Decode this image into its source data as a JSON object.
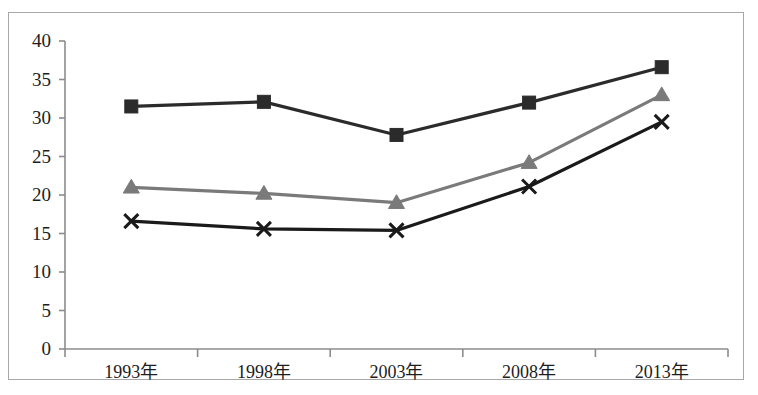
{
  "chart_data": {
    "type": "line",
    "title": "",
    "subtitle": "",
    "xlabel": "",
    "ylabel": "",
    "categories": [
      "1993年",
      "1998年",
      "2003年",
      "2008年",
      "2013年"
    ],
    "ylim": [
      0,
      40
    ],
    "yticks": [
      0,
      5,
      10,
      15,
      20,
      25,
      30,
      35,
      40
    ],
    "ytick_labels": [
      "0",
      "5",
      "10",
      "15",
      "20",
      "25",
      "30",
      "35",
      "40"
    ],
    "grid": false,
    "legend": "none",
    "series": [
      {
        "name": "series-square",
        "marker": "square",
        "color": "#2b2b2b",
        "values": [
          31.5,
          32.1,
          27.8,
          32.0,
          36.6
        ]
      },
      {
        "name": "series-triangle",
        "marker": "triangle",
        "color": "#7a7a7a",
        "values": [
          21.0,
          20.2,
          19.0,
          24.2,
          33.0
        ]
      },
      {
        "name": "series-cross",
        "marker": "cross",
        "color": "#1a1a1a",
        "values": [
          16.6,
          15.6,
          15.4,
          21.1,
          29.5
        ]
      }
    ],
    "axis_color": "#8c8c8c",
    "border_color": "#a8a8a8",
    "background": "#ffffff"
  }
}
